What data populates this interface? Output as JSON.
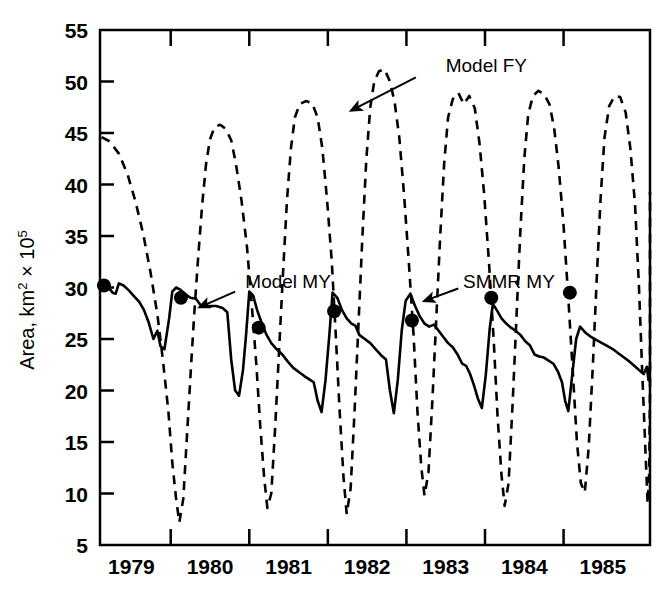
{
  "chart_data": {
    "type": "line",
    "title": "",
    "xlabel": "",
    "ylabel": "Area, km2 x 10^5",
    "ylabel_main": "Area, km",
    "ylabel_sup1": "2",
    "ylabel_mid": " × 10",
    "ylabel_sup2": "5",
    "xlim": [
      1978.6,
      1985.6
    ],
    "ylim": [
      5,
      55
    ],
    "yticks": [
      5,
      10,
      15,
      20,
      25,
      30,
      35,
      40,
      45,
      50,
      55
    ],
    "ytick_labels": [
      "5",
      "10",
      "15",
      "20",
      "25",
      "30",
      "35",
      "40",
      "45",
      "50",
      "55"
    ],
    "xticks": [
      1979,
      1980,
      1981,
      1982,
      1983,
      1984,
      1985
    ],
    "xtick_labels": [
      "1979",
      "1980",
      "1981",
      "1982",
      "1983",
      "1984",
      "1985"
    ],
    "xlabel_positions": [
      1979.0,
      1980.0,
      1981.0,
      1982.0,
      1983.0,
      1984.0,
      1985.0
    ],
    "grid": false,
    "legend": "none",
    "annotations": [
      {
        "id": "model-fy",
        "text": "Model FY",
        "text_x": 1983.0,
        "text_y": 51.6,
        "arrow_from_x": 1982.62,
        "arrow_from_y": 50.4,
        "arrow_to_x": 1981.8,
        "arrow_to_y": 47.2
      },
      {
        "id": "model-my",
        "text": "Model MY",
        "text_x": 1980.45,
        "text_y": 30.6,
        "arrow_from_x": 1980.32,
        "arrow_from_y": 29.6,
        "arrow_to_x": 1979.87,
        "arrow_to_y": 28.1
      },
      {
        "id": "smmr-my",
        "text": "SMMR MY",
        "text_x": 1983.22,
        "text_y": 30.6,
        "arrow_from_x": 1983.16,
        "arrow_from_y": 29.9,
        "arrow_to_x": 1982.73,
        "arrow_to_y": 28.7
      }
    ],
    "series": [
      {
        "name": "Model FY",
        "style": "dashed",
        "color": "#000000",
        "points": [
          [
            1978.62,
            44.6
          ],
          [
            1978.72,
            44.2
          ],
          [
            1978.84,
            43.0
          ],
          [
            1978.95,
            41.0
          ],
          [
            1979.05,
            38.4
          ],
          [
            1979.15,
            35.2
          ],
          [
            1979.24,
            31.6
          ],
          [
            1979.33,
            27.4
          ],
          [
            1979.4,
            23.0
          ],
          [
            1979.47,
            18.0
          ],
          [
            1979.52,
            13.0
          ],
          [
            1979.57,
            9.4
          ],
          [
            1979.61,
            7.2
          ],
          [
            1979.66,
            9.5
          ],
          [
            1979.71,
            16.0
          ],
          [
            1979.76,
            22.5
          ],
          [
            1979.8,
            27.5
          ],
          [
            1979.85,
            33.0
          ],
          [
            1979.9,
            38.0
          ],
          [
            1979.95,
            42.0
          ],
          [
            1980.0,
            44.4
          ],
          [
            1980.06,
            45.6
          ],
          [
            1980.13,
            45.8
          ],
          [
            1980.2,
            45.4
          ],
          [
            1980.27,
            44.3
          ],
          [
            1980.33,
            42.0
          ],
          [
            1980.4,
            38.5
          ],
          [
            1980.47,
            34.0
          ],
          [
            1980.53,
            28.5
          ],
          [
            1980.59,
            22.5
          ],
          [
            1980.64,
            16.5
          ],
          [
            1980.69,
            11.5
          ],
          [
            1980.73,
            8.6
          ],
          [
            1980.78,
            10.0
          ],
          [
            1980.83,
            16.5
          ],
          [
            1980.88,
            24.0
          ],
          [
            1980.93,
            31.5
          ],
          [
            1980.98,
            38.5
          ],
          [
            1981.03,
            43.5
          ],
          [
            1981.08,
            46.5
          ],
          [
            1981.14,
            47.8
          ],
          [
            1981.22,
            48.1
          ],
          [
            1981.3,
            47.9
          ],
          [
            1981.37,
            46.5
          ],
          [
            1981.43,
            43.5
          ],
          [
            1981.49,
            38.5
          ],
          [
            1981.55,
            32.5
          ],
          [
            1981.6,
            25.5
          ],
          [
            1981.65,
            18.0
          ],
          [
            1981.7,
            11.5
          ],
          [
            1981.74,
            8.0
          ],
          [
            1981.79,
            10.5
          ],
          [
            1981.84,
            18.0
          ],
          [
            1981.89,
            26.5
          ],
          [
            1981.94,
            35.0
          ],
          [
            1981.99,
            42.5
          ],
          [
            1982.04,
            47.5
          ],
          [
            1982.09,
            50.0
          ],
          [
            1982.15,
            51.0
          ],
          [
            1982.22,
            51.2
          ],
          [
            1982.29,
            50.0
          ],
          [
            1982.35,
            48.0
          ],
          [
            1982.41,
            44.5
          ],
          [
            1982.47,
            39.0
          ],
          [
            1982.53,
            32.5
          ],
          [
            1982.59,
            25.5
          ],
          [
            1982.64,
            18.0
          ],
          [
            1982.69,
            12.5
          ],
          [
            1982.73,
            9.8
          ],
          [
            1982.78,
            12.0
          ],
          [
            1982.83,
            19.0
          ],
          [
            1982.88,
            27.0
          ],
          [
            1982.93,
            35.0
          ],
          [
            1982.98,
            42.0
          ],
          [
            1983.03,
            46.5
          ],
          [
            1983.09,
            48.3
          ],
          [
            1983.16,
            48.9
          ],
          [
            1983.23,
            47.8
          ],
          [
            1983.3,
            48.6
          ],
          [
            1983.37,
            47.4
          ],
          [
            1983.43,
            44.0
          ],
          [
            1983.49,
            39.0
          ],
          [
            1983.55,
            32.5
          ],
          [
            1983.61,
            25.0
          ],
          [
            1983.66,
            17.5
          ],
          [
            1983.71,
            11.8
          ],
          [
            1983.75,
            8.8
          ],
          [
            1983.8,
            11.0
          ],
          [
            1983.85,
            18.5
          ],
          [
            1983.9,
            27.0
          ],
          [
            1983.95,
            35.5
          ],
          [
            1984.0,
            42.5
          ],
          [
            1984.05,
            46.8
          ],
          [
            1984.11,
            48.6
          ],
          [
            1984.18,
            49.1
          ],
          [
            1984.25,
            48.8
          ],
          [
            1984.32,
            47.8
          ],
          [
            1984.38,
            45.5
          ],
          [
            1984.44,
            41.5
          ],
          [
            1984.5,
            36.0
          ],
          [
            1984.56,
            29.0
          ],
          [
            1984.62,
            21.5
          ],
          [
            1984.67,
            15.0
          ],
          [
            1984.72,
            11.0
          ],
          [
            1984.77,
            10.1
          ],
          [
            1984.82,
            14.5
          ],
          [
            1984.87,
            22.0
          ],
          [
            1984.92,
            30.5
          ],
          [
            1984.97,
            38.5
          ],
          [
            1985.02,
            44.5
          ],
          [
            1985.08,
            47.6
          ],
          [
            1985.15,
            48.6
          ],
          [
            1985.22,
            48.5
          ],
          [
            1985.29,
            47.0
          ],
          [
            1985.35,
            43.5
          ],
          [
            1985.41,
            38.0
          ],
          [
            1985.46,
            30.0
          ],
          [
            1985.5,
            22.0
          ],
          [
            1985.54,
            14.5
          ],
          [
            1985.57,
            9.0
          ],
          [
            1985.59,
            12.0
          ],
          [
            1985.6,
            20.0
          ],
          [
            1985.6,
            30.0
          ],
          [
            1985.6,
            39.3
          ]
        ]
      },
      {
        "name": "Model MY",
        "style": "solid",
        "color": "#000000",
        "points": [
          [
            1978.62,
            30.1
          ],
          [
            1978.7,
            30.1
          ],
          [
            1978.76,
            29.5
          ],
          [
            1978.8,
            29.4
          ],
          [
            1978.84,
            30.4
          ],
          [
            1978.9,
            30.2
          ],
          [
            1978.97,
            29.7
          ],
          [
            1979.04,
            29.1
          ],
          [
            1979.1,
            28.6
          ],
          [
            1979.16,
            27.8
          ],
          [
            1979.22,
            26.6
          ],
          [
            1979.28,
            25.0
          ],
          [
            1979.33,
            25.8
          ],
          [
            1979.37,
            24.3
          ],
          [
            1979.42,
            24.0
          ],
          [
            1979.48,
            27.0
          ],
          [
            1979.52,
            29.6
          ],
          [
            1979.57,
            30.0
          ],
          [
            1979.62,
            29.8
          ],
          [
            1979.68,
            29.4
          ],
          [
            1979.75,
            29.0
          ],
          [
            1979.82,
            28.9
          ],
          [
            1979.88,
            28.3
          ],
          [
            1979.94,
            28.2
          ],
          [
            1980.02,
            28.2
          ],
          [
            1980.08,
            28.2
          ],
          [
            1980.16,
            28.0
          ],
          [
            1980.22,
            27.6
          ],
          [
            1980.27,
            23.0
          ],
          [
            1980.32,
            20.0
          ],
          [
            1980.37,
            19.5
          ],
          [
            1980.42,
            22.0
          ],
          [
            1980.46,
            25.5
          ],
          [
            1980.5,
            29.6
          ],
          [
            1980.55,
            29.2
          ],
          [
            1980.6,
            27.8
          ],
          [
            1980.66,
            26.5
          ],
          [
            1980.72,
            25.4
          ],
          [
            1980.78,
            24.6
          ],
          [
            1980.85,
            24.0
          ],
          [
            1980.92,
            23.5
          ],
          [
            1980.99,
            22.8
          ],
          [
            1981.06,
            22.2
          ],
          [
            1981.13,
            21.8
          ],
          [
            1981.2,
            21.4
          ],
          [
            1981.26,
            21.1
          ],
          [
            1981.32,
            20.8
          ],
          [
            1981.37,
            19.0
          ],
          [
            1981.42,
            17.9
          ],
          [
            1981.47,
            21.0
          ],
          [
            1981.52,
            25.5
          ],
          [
            1981.56,
            29.5
          ],
          [
            1981.62,
            29.0
          ],
          [
            1981.68,
            27.8
          ],
          [
            1981.74,
            27.0
          ],
          [
            1981.8,
            26.5
          ],
          [
            1981.85,
            26.3
          ],
          [
            1981.9,
            25.4
          ],
          [
            1981.97,
            25.0
          ],
          [
            1982.04,
            24.6
          ],
          [
            1982.11,
            24.0
          ],
          [
            1982.18,
            23.4
          ],
          [
            1982.24,
            23.0
          ],
          [
            1982.29,
            20.0
          ],
          [
            1982.34,
            17.8
          ],
          [
            1982.39,
            21.0
          ],
          [
            1982.44,
            25.8
          ],
          [
            1982.49,
            28.7
          ],
          [
            1982.55,
            29.4
          ],
          [
            1982.61,
            28.2
          ],
          [
            1982.67,
            27.2
          ],
          [
            1982.73,
            26.5
          ],
          [
            1982.79,
            26.2
          ],
          [
            1982.85,
            26.4
          ],
          [
            1982.91,
            25.8
          ],
          [
            1982.97,
            25.2
          ],
          [
            1983.03,
            24.6
          ],
          [
            1983.09,
            24.2
          ],
          [
            1983.15,
            23.5
          ],
          [
            1983.21,
            22.6
          ],
          [
            1983.26,
            22.4
          ],
          [
            1983.31,
            21.6
          ],
          [
            1983.36,
            20.5
          ],
          [
            1983.41,
            19.2
          ],
          [
            1983.46,
            18.3
          ],
          [
            1983.51,
            21.5
          ],
          [
            1983.56,
            26.0
          ],
          [
            1983.6,
            28.4
          ],
          [
            1983.65,
            27.8
          ],
          [
            1983.71,
            27.0
          ],
          [
            1983.77,
            26.5
          ],
          [
            1983.83,
            26.1
          ],
          [
            1983.89,
            25.8
          ],
          [
            1983.95,
            25.4
          ],
          [
            1984.01,
            24.8
          ],
          [
            1984.07,
            24.4
          ],
          [
            1984.13,
            23.5
          ],
          [
            1984.19,
            23.3
          ],
          [
            1984.25,
            23.2
          ],
          [
            1984.31,
            22.9
          ],
          [
            1984.37,
            22.6
          ],
          [
            1984.43,
            21.8
          ],
          [
            1984.48,
            20.8
          ],
          [
            1984.52,
            19.0
          ],
          [
            1984.56,
            18.0
          ],
          [
            1984.61,
            21.5
          ],
          [
            1984.66,
            25.0
          ],
          [
            1984.71,
            26.2
          ],
          [
            1984.78,
            25.6
          ],
          [
            1984.85,
            25.2
          ],
          [
            1984.92,
            24.9
          ],
          [
            1984.99,
            24.6
          ],
          [
            1985.06,
            24.3
          ],
          [
            1985.13,
            24.0
          ],
          [
            1985.2,
            23.6
          ],
          [
            1985.27,
            23.2
          ],
          [
            1985.34,
            22.8
          ],
          [
            1985.4,
            22.4
          ],
          [
            1985.46,
            22.0
          ],
          [
            1985.52,
            21.6
          ],
          [
            1985.56,
            22.3
          ],
          [
            1985.58,
            21.0
          ],
          [
            1985.6,
            22.4
          ]
        ]
      }
    ],
    "scatter": {
      "name": "SMMR MY",
      "marker": "filled-circle",
      "color": "#000000",
      "size": 9,
      "points": [
        [
          1978.65,
          30.2
        ],
        [
          1979.63,
          29.0
        ],
        [
          1980.62,
          26.1
        ],
        [
          1981.58,
          27.7
        ],
        [
          1982.57,
          26.8
        ],
        [
          1983.58,
          29.0
        ],
        [
          1984.58,
          29.5
        ]
      ]
    }
  }
}
